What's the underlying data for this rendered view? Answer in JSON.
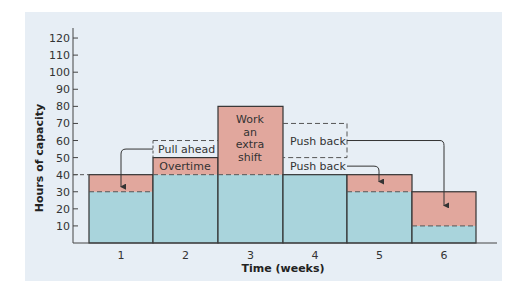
{
  "chart_data": {
    "type": "bar",
    "title": "",
    "xlabel": "Time (weeks)",
    "ylabel": "Hours of capacity",
    "ylim": [
      0,
      120
    ],
    "yticks": [
      10,
      20,
      30,
      40,
      50,
      60,
      70,
      80,
      90,
      100,
      110,
      120
    ],
    "categories": [
      "1",
      "2",
      "3",
      "4",
      "5",
      "6"
    ],
    "series": [
      {
        "name": "Regular capacity",
        "color": "#a9d4dc",
        "values": [
          30,
          40,
          40,
          40,
          30,
          10
        ]
      },
      {
        "name": "Adjusted capacity (added)",
        "color": "#e1a79d",
        "values": [
          10,
          10,
          40,
          0,
          10,
          20
        ]
      }
    ],
    "totals": [
      40,
      50,
      80,
      40,
      40,
      30
    ],
    "annotations": [
      {
        "text": "Pull ahead",
        "from_week": "2",
        "to_week": "1",
        "range": [
          50,
          60
        ]
      },
      {
        "text": "Overtime",
        "week": "2",
        "range": [
          40,
          50
        ]
      },
      {
        "text": "Work an extra shift",
        "week": "3",
        "range": [
          40,
          80
        ]
      },
      {
        "text": "Push back",
        "from_week": "4",
        "to_week": "6",
        "range": [
          50,
          70
        ]
      },
      {
        "text": "Push back",
        "from_week": "4",
        "to_week": "5",
        "range": [
          40,
          50
        ]
      }
    ],
    "grid": false
  },
  "labels": {
    "ylabel": "Hours of capacity",
    "xlabel": "Time (weeks)",
    "pull_ahead": "Pull ahead",
    "overtime": "Overtime",
    "extra_shift": [
      "Work",
      "an",
      "extra",
      "shift"
    ],
    "push_back_1": "Push back",
    "push_back_2": "Push back"
  }
}
